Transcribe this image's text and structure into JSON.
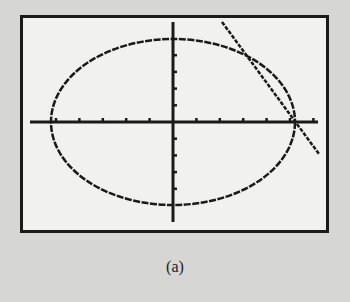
{
  "caption": "(a)",
  "colors": {
    "background": "#d6d6d4",
    "screen": "#f1f1ef",
    "ink": "#1a1a1a"
  },
  "chart_data": {
    "type": "line",
    "title": "",
    "subtitle": "Graphing calculator display: ellipse and intersecting line",
    "xlabel": "",
    "ylabel": "",
    "grid": false,
    "legend": "none",
    "xlim": [
      -6.5,
      6.5
    ],
    "ylim": [
      -4.2,
      4.2
    ],
    "x_ticks": [
      -5,
      -4,
      -3,
      -2,
      -1,
      1,
      2,
      3,
      4,
      5,
      6
    ],
    "y_ticks": [
      -4,
      -3,
      -2,
      -1,
      1,
      2,
      3,
      4
    ],
    "series": [
      {
        "name": "ellipse",
        "kind": "ellipse",
        "center": [
          0,
          0
        ],
        "semi_axis_x": 5.2,
        "semi_axis_y": 3.5
      },
      {
        "name": "line",
        "kind": "line",
        "x": [
          2.1,
          6.3
        ],
        "y": [
          4.2,
          -1.4
        ]
      }
    ],
    "intersections": [
      [
        3.3,
        2.7
      ],
      [
        5.2,
        0
      ]
    ],
    "annotations": [
      "(a)"
    ]
  }
}
